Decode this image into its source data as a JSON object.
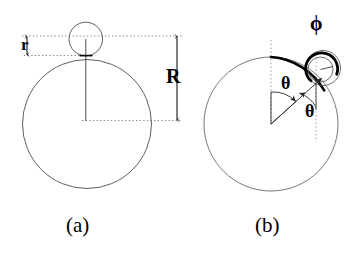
{
  "figure": {
    "background_color": "#ffffff",
    "stroke_color": "#000000",
    "thin_stroke_color": "#555555",
    "dotted_color": "#888888",
    "panels": [
      {
        "id": "a",
        "caption": "(a)",
        "description": "Small circle of radius r resting on top of a large circle of radius R, with dimension arrows labelling r and R",
        "labels": [
          {
            "name": "radius-small",
            "text": "r"
          },
          {
            "name": "radius-large",
            "text": "R"
          }
        ],
        "geometry": {
          "large_circle": {
            "cx": 87,
            "cy": 124,
            "r": 64
          },
          "small_circle": {
            "cx": 86,
            "cy": 39,
            "r": 17
          },
          "center_line": {
            "x": 86,
            "y1": 39,
            "y2": 124
          },
          "dotted_lines": [
            {
              "y": 36,
              "x1": 22,
              "x2": 182
            },
            {
              "y": 55,
              "x1": 24,
              "x2": 92
            },
            {
              "y": 120,
              "x1": 82,
              "x2": 182
            }
          ],
          "dimension_arrows": [
            {
              "name": "r-arrow",
              "x": 27,
              "y1": 36,
              "y2": 55
            },
            {
              "name": "R-arrow",
              "x": 177,
              "y1": 36,
              "y2": 120
            }
          ]
        }
      },
      {
        "id": "b",
        "caption": "(b)",
        "description": "Small circle rolled around a large circle through angle theta, with rolled arc highlighted and angle phi marked on the small circle",
        "labels": [
          {
            "name": "angle-phi",
            "text": "ϕ"
          },
          {
            "name": "angle-theta-center",
            "text": "θ"
          },
          {
            "name": "angle-theta-contact",
            "text": "θ"
          }
        ],
        "geometry": {
          "large_circle": {
            "cx": 271,
            "cy": 124,
            "r": 67
          },
          "small_circle": {
            "cx": 316,
            "cy": 62,
            "r": 17
          },
          "contact_point": {
            "x": 307,
            "y": 74
          },
          "theta_degrees": 36,
          "dotted_lines": [
            {
              "name": "vertical-through-center",
              "x": 271,
              "y1": 40,
              "y2": 126
            },
            {
              "name": "vertical-through-small-circle",
              "x": 316,
              "y1": 62,
              "y2": 140
            }
          ],
          "highlighted_arc": {
            "name": "rolled-arc",
            "from_deg": -90,
            "to_deg": -38,
            "stroke_width": 3
          },
          "phi_arc": {
            "name": "phi-arc",
            "from_deg": -150,
            "to_deg": 110,
            "stroke_width": 3
          }
        }
      }
    ]
  }
}
